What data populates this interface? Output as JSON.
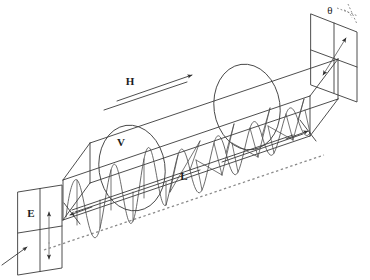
{
  "figure": {
    "background_color": "#ffffff",
    "line_color": "#3a3a3a",
    "axis_color": "#8a8a8a",
    "text_color": "#1c1c1c",
    "width": 370,
    "height": 280
  },
  "labels": {
    "field_h": "H",
    "velocity_v": "V",
    "length_l": "L",
    "field_e": "E",
    "angle_theta": "θ"
  },
  "elements": {
    "input_panel_name": "input polarizer plane",
    "output_panel_name": "output analyzer plane",
    "cylinder_name": "medium cylinder",
    "wave_name": "polarized wave",
    "axis_name": "optical axis",
    "incoming_ray_name": "incident light ray"
  }
}
